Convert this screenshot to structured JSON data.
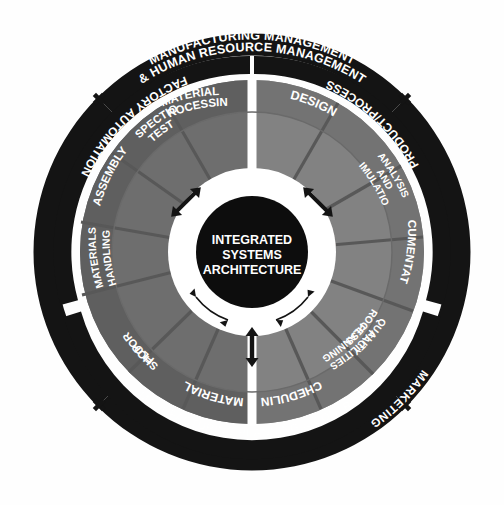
{
  "diagram": {
    "background_color": "#fefefe",
    "outer_ring_color": "#141414",
    "inner_ring_color": "#141414",
    "core_color": "#0d0d0d",
    "sector_color_left": "#6e6e6e",
    "sector_color_right": "#828282",
    "band_color_left": "#5a5a5a",
    "band_color_right": "#6d6d6d",
    "divider_color": "#ffffff",
    "label_color": "#ffffff"
  },
  "outer_ring": {
    "name": "outer-ring",
    "segments": [
      {
        "id": "top",
        "line1": "MANUFACTURING MANAGEMENT",
        "line2": "& HUMAN RESOURCE MANAGEMENT"
      },
      {
        "id": "right",
        "line1": "MARKETING",
        "line2": ""
      },
      {
        "id": "bottom",
        "line1": "STRATEGIC PLANNING",
        "line2": ""
      },
      {
        "id": "left",
        "line1": "FINANCE",
        "line2": ""
      }
    ],
    "connector_icon": "plus-icon",
    "connector_count": 4
  },
  "inner_ring": {
    "name": "inner-ring",
    "segments": [
      {
        "id": "left",
        "label": "FACTORY AUTOMATION"
      },
      {
        "id": "right",
        "label": "PRODUCT/PROCESS"
      },
      {
        "id": "bottom",
        "label": "MANUFACTURING PLANNING & CONTROL"
      }
    ]
  },
  "sectors": [
    {
      "id": "materials-processing",
      "line1": "MATERIALS",
      "line2": "PROCESSING"
    },
    {
      "id": "inspection-test",
      "line1": "INSPECTION",
      "line2": "TEST"
    },
    {
      "id": "assembly",
      "line1": "ASSEMBLY",
      "line2": ""
    },
    {
      "id": "materials-handling",
      "line1": "MATERIALS",
      "line2": "HANDLING"
    },
    {
      "id": "shop-floor",
      "line1": "SHOP",
      "line2": "FLOOR"
    },
    {
      "id": "material",
      "line1": "MATERIAL",
      "line2": ""
    },
    {
      "id": "scheduling",
      "line1": "SCHEDULING",
      "line2": ""
    },
    {
      "id": "quality-process",
      "line1": "QUALITY",
      "line2": "PROCESS &"
    },
    {
      "id": "facilities-planning",
      "line1": "FACILITIES",
      "line2": "PLANNING"
    },
    {
      "id": "documentation",
      "line1": "DOCUMENTATION",
      "line2": ""
    },
    {
      "id": "analysis-simulation",
      "line1": "ANALYSIS",
      "line2": "AND",
      "line3": "SIMULATION"
    },
    {
      "id": "design",
      "line1": "DESIGN",
      "line2": ""
    }
  ],
  "hub": {
    "top_arc_label": "INFORMATION RESOURCE MGMT. & COMMUNICATIONS",
    "bottom_arc_label": "COMMON DATA",
    "core_lines": [
      "INTEGRATED",
      "SYSTEMS",
      "ARCHITECTURE"
    ],
    "arrow_icon": "double-headed-arrow-icon",
    "arrow_count": 3
  }
}
